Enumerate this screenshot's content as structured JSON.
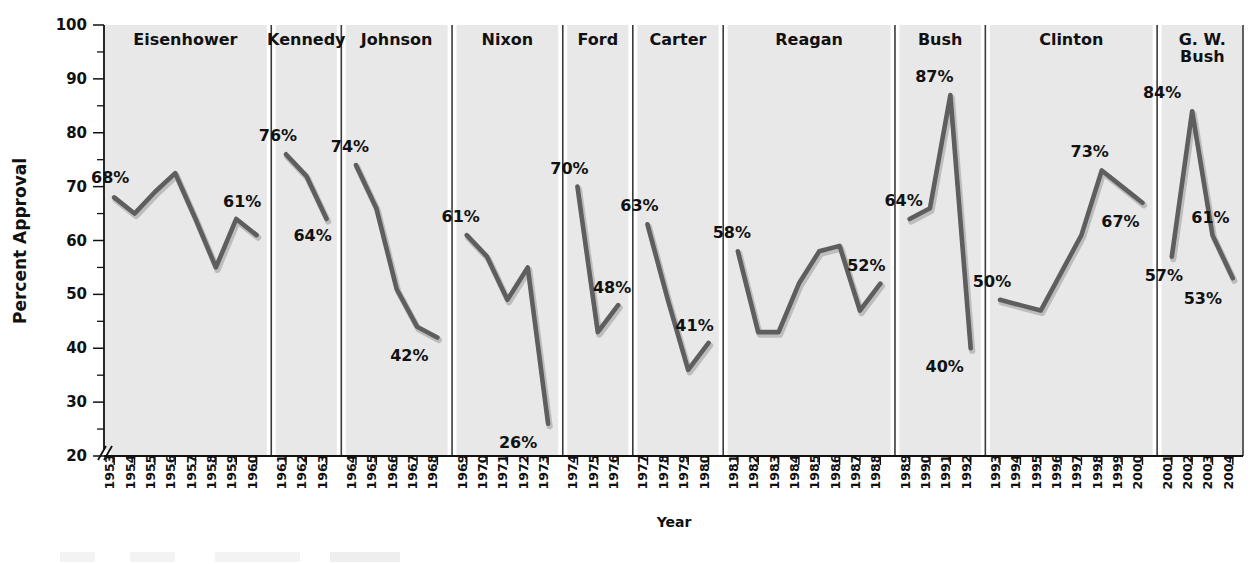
{
  "chart_data": {
    "type": "line",
    "title": "",
    "xlabel": "Year",
    "ylabel": "Percent Approval",
    "ylim": [
      20,
      100
    ],
    "ytick_labels": [
      "20",
      "30",
      "40",
      "50",
      "60",
      "70",
      "80",
      "90",
      "100"
    ],
    "ytick_values": [
      20,
      30,
      40,
      50,
      60,
      70,
      80,
      90,
      100
    ],
    "minor_tick_step": 5,
    "axis_break_at_bottom": true,
    "grid": false,
    "legend_position": "none",
    "line_color": "#5e5e5e",
    "panel_bg_color": "#e8e8e8",
    "panels": [
      {
        "name": "Eisenhower",
        "years": [
          "1953",
          "1954",
          "1955",
          "1956",
          "1957",
          "1958",
          "1959",
          "1960"
        ],
        "values": [
          68,
          65,
          69,
          72.5,
          64,
          55,
          64,
          61
        ],
        "annotations": [
          {
            "text": "68%",
            "year": "1953",
            "value": 68,
            "dx": -4,
            "dy": -14
          },
          {
            "text": "61%",
            "year": "1959",
            "value": 64,
            "dx": 6,
            "dy": -12
          }
        ]
      },
      {
        "name": "Kennedy",
        "years": [
          "1961",
          "1962",
          "1963"
        ],
        "values": [
          76,
          72,
          64
        ],
        "annotations": [
          {
            "text": "76%",
            "year": "1961",
            "value": 76,
            "dx": -8,
            "dy": -13
          },
          {
            "text": "64%",
            "year": "1963",
            "value": 64,
            "dx": -14,
            "dy": 22
          }
        ]
      },
      {
        "name": "Johnson",
        "years": [
          "1964",
          "1965",
          "1966",
          "1967",
          "1968"
        ],
        "values": [
          74,
          66,
          51,
          44,
          42
        ],
        "annotations": [
          {
            "text": "74%",
            "year": "1964",
            "value": 74,
            "dx": -6,
            "dy": -13
          },
          {
            "text": "42%",
            "year": "1968",
            "value": 42,
            "dx": -28,
            "dy": 24
          }
        ]
      },
      {
        "name": "Nixon",
        "years": [
          "1969",
          "1970",
          "1971",
          "1972",
          "1973"
        ],
        "values": [
          61,
          57,
          49,
          55,
          26
        ],
        "annotations": [
          {
            "text": "61%",
            "year": "1969",
            "value": 61,
            "dx": -6,
            "dy": -13
          },
          {
            "text": "26%",
            "year": "1973",
            "value": 26,
            "dx": -30,
            "dy": 24
          }
        ]
      },
      {
        "name": "Ford",
        "years": [
          "1974",
          "1975",
          "1976"
        ],
        "values": [
          70,
          43,
          48
        ],
        "annotations": [
          {
            "text": "70%",
            "year": "1974",
            "value": 70,
            "dx": -8,
            "dy": -13
          },
          {
            "text": "48%",
            "year": "1976",
            "value": 48,
            "dx": -6,
            "dy": -12
          }
        ]
      },
      {
        "name": "Carter",
        "years": [
          "1977",
          "1978",
          "1979",
          "1980"
        ],
        "values": [
          63,
          49,
          36,
          41
        ],
        "annotations": [
          {
            "text": "63%",
            "year": "1977",
            "value": 63,
            "dx": -8,
            "dy": -13
          },
          {
            "text": "41%",
            "year": "1980",
            "value": 41,
            "dx": -14,
            "dy": -12
          }
        ]
      },
      {
        "name": "Reagan",
        "years": [
          "1981",
          "1982",
          "1983",
          "1984",
          "1985",
          "1986",
          "1987",
          "1988"
        ],
        "values": [
          58,
          43,
          43,
          52,
          58,
          59,
          47,
          52
        ],
        "annotations": [
          {
            "text": "58%",
            "year": "1981",
            "value": 58,
            "dx": -6,
            "dy": -13
          },
          {
            "text": "52%",
            "year": "1988",
            "value": 52,
            "dx": -14,
            "dy": -13
          }
        ]
      },
      {
        "name": "Bush",
        "years": [
          "1989",
          "1990",
          "1991",
          "1992"
        ],
        "values": [
          64,
          66,
          87,
          40
        ],
        "annotations": [
          {
            "text": "64%",
            "year": "1989",
            "value": 64,
            "dx": -6,
            "dy": -13
          },
          {
            "text": "87%",
            "year": "1991",
            "value": 87,
            "dx": -16,
            "dy": -13
          },
          {
            "text": "40%",
            "year": "1992",
            "value": 40,
            "dx": -26,
            "dy": 24
          }
        ]
      },
      {
        "name": "Clinton",
        "years": [
          "1993",
          "1994",
          "1995",
          "1996",
          "1997",
          "1998",
          "1999",
          "2000"
        ],
        "values": [
          49,
          48,
          47,
          54,
          61,
          73,
          70,
          67
        ],
        "annotations": [
          {
            "text": "50%",
            "year": "1993",
            "value": 49,
            "dx": -8,
            "dy": -13
          },
          {
            "text": "73%",
            "year": "1998",
            "value": 73,
            "dx": -12,
            "dy": -13
          },
          {
            "text": "67%",
            "year": "2000",
            "value": 67,
            "dx": -22,
            "dy": 24
          }
        ]
      },
      {
        "name": "G. W. Bush",
        "name_line1": "G. W.",
        "name_line2": "Bush",
        "years": [
          "2001",
          "2002",
          "2003",
          "2004"
        ],
        "values": [
          57,
          84,
          61,
          53
        ],
        "annotations": [
          {
            "text": "84%",
            "year": "2002",
            "value": 84,
            "dx": -30,
            "dy": -13
          },
          {
            "text": "57%",
            "year": "2001",
            "value": 57,
            "dx": -8,
            "dy": 24
          },
          {
            "text": "61%",
            "year": "2003",
            "value": 61,
            "dx": -2,
            "dy": -12
          },
          {
            "text": "53%",
            "year": "2004",
            "value": 53,
            "dx": -30,
            "dy": 26
          }
        ]
      }
    ]
  }
}
